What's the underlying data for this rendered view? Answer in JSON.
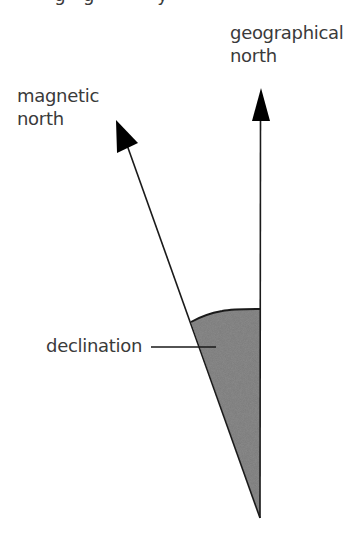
{
  "diagram": {
    "title_clipped": "magnetic declination, geographic north and magnetic north (text clipped at top edge)",
    "labels": {
      "geographical_north_line1": "geographical",
      "geographical_north_line2": "north",
      "magnetic_north_line1": "magnetic",
      "magnetic_north_line2": "north",
      "declination": "declination"
    },
    "colors": {
      "line": "#1a1a1a",
      "arrowhead": "#000000",
      "shading": "#7a7a7a",
      "text": "#3a3a3a",
      "background": "#ffffff"
    },
    "geometry": {
      "origin": [
        260,
        518
      ],
      "geographical_arrow_tip": [
        261,
        88
      ],
      "magnetic_arrow_tip": [
        116,
        120
      ],
      "shaded_arc_top_y": 309
    }
  }
}
